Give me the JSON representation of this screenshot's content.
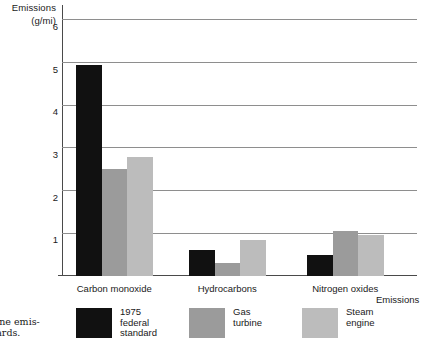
{
  "chart_data": {
    "type": "bar",
    "title": "",
    "xlabel": "Emissions",
    "ylabel": "Emissions (g/mi)",
    "ylabel_line1": "Emissions",
    "ylabel_line2": "(g/mi)",
    "categories": [
      "Carbon monoxide",
      "Hydrocarbons",
      "Nitrogen oxides"
    ],
    "series": [
      {
        "name": "1975 federal standard",
        "name_line1": "1975",
        "name_line2": "federal",
        "name_line3": "standard",
        "color": "#111111",
        "values": [
          4.95,
          0.6,
          0.5
        ]
      },
      {
        "name": "Gas turbine",
        "name_line1": "Gas",
        "name_line2": "turbine",
        "name_line3": "",
        "color": "#9b9b9b",
        "values": [
          2.5,
          0.3,
          1.05
        ]
      },
      {
        "name": "Steam engine",
        "name_line1": "Steam",
        "name_line2": "engine",
        "name_line3": "",
        "color": "#bcbcbc",
        "values": [
          2.8,
          0.85,
          0.95
        ]
      }
    ],
    "ylim": [
      0,
      6.35
    ],
    "yticks": [
      1,
      2,
      3,
      4,
      5,
      6
    ],
    "ytick_labels": [
      "1",
      "2",
      "3",
      "4",
      "5",
      "6"
    ],
    "grid": true,
    "grid_color": "#8e8e8e",
    "axis_color": "#4a4a4a",
    "legend_position": "bottom"
  },
  "caption": {
    "line1": "ngine emis-",
    "line2": "ndards."
  }
}
